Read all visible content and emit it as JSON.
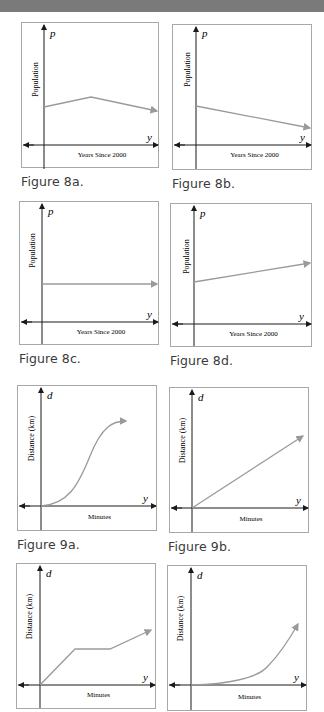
{
  "figures": [
    {
      "id": "8a",
      "caption": "Figure 8a.",
      "vertical_var": "p",
      "horizontal_var": "y",
      "ylabel": "Population",
      "xlabel": "Years Since 2000",
      "shape": "increase then decrease"
    },
    {
      "id": "8b",
      "caption": "Figure 8b.",
      "vertical_var": "p",
      "horizontal_var": "y",
      "ylabel": "Population",
      "xlabel": "Years Since 2000",
      "shape": "linear decreasing"
    },
    {
      "id": "8c",
      "caption": "Figure 8c.",
      "vertical_var": "p",
      "horizontal_var": "y",
      "ylabel": "Population",
      "xlabel": "Years Since 2000",
      "shape": "constant"
    },
    {
      "id": "8d",
      "caption": "Figure 8d.",
      "vertical_var": "p",
      "horizontal_var": "y",
      "ylabel": "Population",
      "xlabel": "Years Since 2000",
      "shape": "linear increasing"
    },
    {
      "id": "9a",
      "caption": "Figure 9a.",
      "vertical_var": "d",
      "horizontal_var": "y",
      "ylabel": "Distance (km)",
      "xlabel": "Minutes",
      "shape": "S-curve from origin"
    },
    {
      "id": "9b",
      "caption": "Figure 9b.",
      "vertical_var": "d",
      "horizontal_var": "y",
      "ylabel": "Distance (km)",
      "xlabel": "Minutes",
      "shape": "linear from origin"
    },
    {
      "id": "9c",
      "vertical_var": "d",
      "horizontal_var": "y",
      "ylabel": "Distance (km)",
      "xlabel": "Minutes",
      "shape": "rise, flat, rise"
    },
    {
      "id": "9d",
      "vertical_var": "d",
      "horizontal_var": "y",
      "ylabel": "Distance (km)",
      "xlabel": "Minutes",
      "shape": "concave up from origin"
    }
  ],
  "colors": {
    "curve": "#9a9a9a",
    "axis": "#1a1a1a",
    "frame": "#a8a8a8",
    "topbar": "#7a7a7a"
  }
}
